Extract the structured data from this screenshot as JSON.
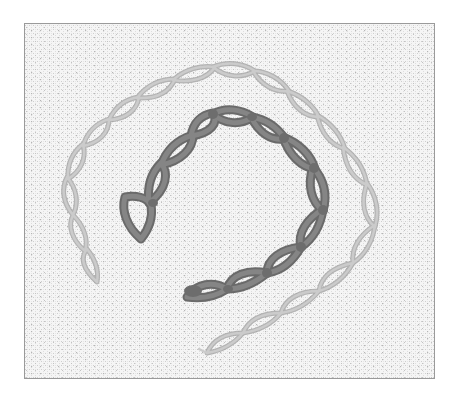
{
  "image": {
    "subject": "chain stitch embroidery on linen",
    "alt": "Two curved rows of chain stitch on even-weave linen: an outer row in pale thread and an inner row in darker, thicker thread",
    "colors": {
      "background": "#ffffff",
      "fabric": "#f4f4f4",
      "fabric_weave": "#c8c8c8",
      "frame_border": "#9a9a9a",
      "outer_chain_thread": "#bdbdbd",
      "outer_chain_shadow": "#9e9e9e",
      "inner_chain_thread": "#7e7e7e",
      "inner_chain_shadow": "#5f5f5f"
    },
    "stitch_rows": [
      {
        "name": "outer-light-chain",
        "loops": 16
      },
      {
        "name": "inner-dark-chain",
        "loops": 10
      }
    ]
  }
}
